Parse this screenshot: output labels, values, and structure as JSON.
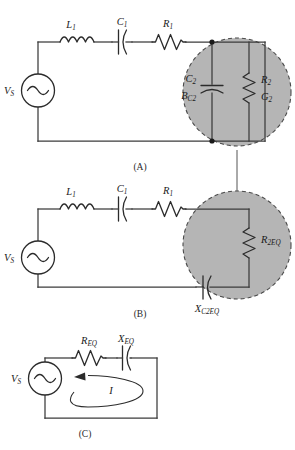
{
  "figure": {
    "background_color": "#ffffff",
    "blob_fill_color": "#b5b5b5",
    "blob_stroke_color": "#4a4a4a",
    "wire_color": "#3b3b3b",
    "panel_count": 3
  },
  "panels": [
    {
      "id": "panel-a",
      "caption": "(A)",
      "source": {
        "label": "V",
        "sub": "S",
        "type": "ac-voltage-source"
      },
      "series_components": [
        {
          "label": "L",
          "sub": "1",
          "type": "inductor"
        },
        {
          "label": "C",
          "sub": "1",
          "type": "capacitor"
        },
        {
          "label": "R",
          "sub": "1",
          "type": "resistor"
        }
      ],
      "blob_components": [
        {
          "label": "C",
          "sub": "2",
          "type": "capacitor"
        },
        {
          "label": "B",
          "sub": "C2",
          "type": "susceptance"
        },
        {
          "label": "R",
          "sub": "2",
          "type": "resistor"
        },
        {
          "label": "G",
          "sub": "2",
          "type": "conductance"
        }
      ]
    },
    {
      "id": "panel-b",
      "caption": "(B)",
      "source": {
        "label": "V",
        "sub": "S",
        "type": "ac-voltage-source"
      },
      "series_components": [
        {
          "label": "L",
          "sub": "1",
          "type": "inductor"
        },
        {
          "label": "C",
          "sub": "1",
          "type": "capacitor"
        },
        {
          "label": "R",
          "sub": "1",
          "type": "resistor"
        }
      ],
      "blob_components": [
        {
          "label": "R",
          "sub": "2EQ",
          "type": "resistor"
        },
        {
          "label": "X",
          "sub": "C2EQ",
          "type": "capacitive-reactance"
        }
      ]
    },
    {
      "id": "panel-c",
      "caption": "(C)",
      "source": {
        "label": "V",
        "sub": "S",
        "type": "ac-voltage-source"
      },
      "series_components": [
        {
          "label": "R",
          "sub": "EQ",
          "type": "resistor"
        },
        {
          "label": "X",
          "sub": "EQ",
          "type": "capacitor"
        }
      ],
      "loop_current": {
        "label": "I",
        "sub": "",
        "direction": "counterclockwise"
      }
    }
  ],
  "labels": {
    "vs_a": "V",
    "vs_a_sub": "S",
    "l1_a": "L",
    "l1_a_sub": "1",
    "c1_a": "C",
    "c1_a_sub": "1",
    "r1_a": "R",
    "r1_a_sub": "1",
    "c2_a": "C",
    "c2_a_sub": "2",
    "bc2_a": "B",
    "bc2_a_sub": "C2",
    "r2_a": "R",
    "r2_a_sub": "2",
    "g2_a": "G",
    "g2_a_sub": "2",
    "caption_a": "(A)",
    "vs_b": "V",
    "vs_b_sub": "S",
    "l1_b": "L",
    "l1_b_sub": "1",
    "c1_b": "C",
    "c1_b_sub": "1",
    "r1_b": "R",
    "r1_b_sub": "1",
    "r2eq_b": "R",
    "r2eq_b_sub": "2EQ",
    "xc2eq_b": "X",
    "xc2eq_b_sub": "C2EQ",
    "caption_b": "(B)",
    "vs_c": "V",
    "vs_c_sub": "S",
    "req_c": "R",
    "req_c_sub": "EQ",
    "xeq_c": "X",
    "xeq_c_sub": "EQ",
    "i_c": "I",
    "caption_c": "(C)"
  }
}
